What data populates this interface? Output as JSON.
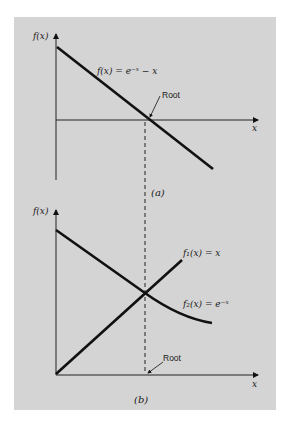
{
  "figure": {
    "panel_a": {
      "y_axis_label": "f(x)",
      "x_axis_label": "x",
      "curve_label": "f(x) = e⁻ˣ − x",
      "root_label": "Root",
      "caption": "(a)"
    },
    "panel_b": {
      "y_axis_label": "f(x)",
      "x_axis_label": "x",
      "curve1_label": "f₁(x) = x",
      "curve2_label": "f₂(x) = e⁻ˣ",
      "root_label": "Root",
      "caption": "(b)"
    },
    "colors": {
      "background": "#d4d4d4",
      "ink": "#111111"
    }
  }
}
